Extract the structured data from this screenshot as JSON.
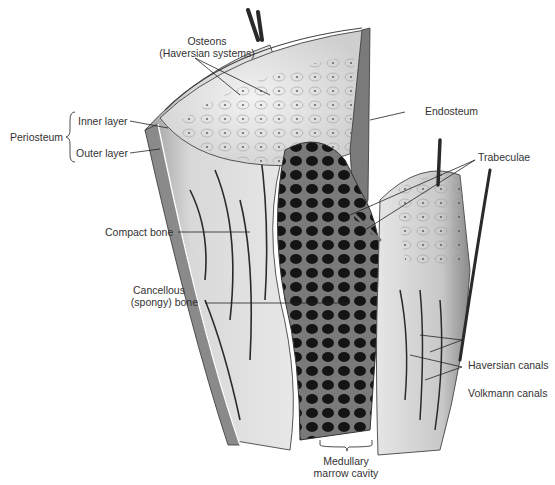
{
  "figure": {
    "labels": {
      "osteons_line1": "Osteons",
      "osteons_line2": "(Haversian systems)",
      "periosteum": "Periosteum",
      "inner_layer": "Inner layer",
      "outer_layer": "Outer layer",
      "endosteum": "Endosteum",
      "trabeculae": "Trabeculae",
      "compact_bone": "Compact bone",
      "cancellous_line1": "Cancellous",
      "cancellous_line2": "(spongy) bone",
      "haversian_canals": "Haversian canals",
      "volkmann_canals": "Volkmann canals",
      "medullary_line1": "Medullary",
      "medullary_line2": "marrow cavity"
    },
    "colors": {
      "background": "#ffffff",
      "label_text": "#333333",
      "leader_line": "#222222",
      "bone_light": "#e2e2e2",
      "bone_mid": "#bdbdbd",
      "spongy_dark": "#1e1e1e",
      "vessel": "#2a2a2a"
    }
  }
}
